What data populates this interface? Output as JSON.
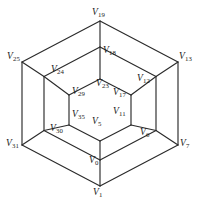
{
  "figure": {
    "type": "graph-diagram",
    "background_color": "#ffffff",
    "edge_color": "#2b2b2b",
    "label_color": "#1a1a1a",
    "width": 200,
    "height": 207
  },
  "graph_data": {
    "type": "diagram",
    "ring_count": 3,
    "vertices_per_ring": 6,
    "rings": [
      {
        "name": "outer",
        "vertices": [
          {
            "id": "V19",
            "prefix": "V",
            "subscript": "19",
            "position": "top",
            "x": 100.0,
            "y": 21.0
          },
          {
            "id": "V13",
            "prefix": "V",
            "subscript": "13",
            "position": "upper-right",
            "x": 178.0,
            "y": 62.0
          },
          {
            "id": "V7",
            "prefix": "V",
            "subscript": "7",
            "position": "lower-right",
            "x": 178.0,
            "y": 145.0
          },
          {
            "id": "V1",
            "prefix": "V",
            "subscript": "1",
            "position": "bottom",
            "x": 100.0,
            "y": 186.0
          },
          {
            "id": "V31",
            "prefix": "V",
            "subscript": "31",
            "position": "lower-left",
            "x": 22.0,
            "y": 145.0
          },
          {
            "id": "V25",
            "prefix": "V",
            "subscript": "25",
            "position": "upper-left",
            "x": 22.0,
            "y": 62.0
          }
        ]
      },
      {
        "name": "middle",
        "vertices": [
          {
            "id": "V18",
            "prefix": "V",
            "subscript": "18",
            "position": "top",
            "x": 100.0,
            "y": 47.0
          },
          {
            "id": "V12",
            "prefix": "V",
            "subscript": "12",
            "position": "upper-right",
            "x": 156.0,
            "y": 76.5
          },
          {
            "id": "V6",
            "prefix": "V",
            "subscript": "6",
            "position": "lower-right",
            "x": 156.0,
            "y": 130.5
          },
          {
            "id": "V0",
            "prefix": "V",
            "subscript": "0",
            "position": "bottom",
            "x": 100.0,
            "y": 160.0
          },
          {
            "id": "V30",
            "prefix": "V",
            "subscript": "30",
            "position": "lower-left",
            "x": 44.0,
            "y": 130.5
          },
          {
            "id": "V24",
            "prefix": "V",
            "subscript": "24",
            "position": "upper-left",
            "x": 44.0,
            "y": 76.5
          }
        ]
      },
      {
        "name": "inner",
        "vertices": [
          {
            "id": "V23",
            "prefix": "V",
            "subscript": "23",
            "position": "top",
            "x": 100.0,
            "y": 79.0
          },
          {
            "id": "V17",
            "prefix": "V",
            "subscript": "17",
            "position": "upper-right",
            "x": 131.0,
            "y": 95.0
          },
          {
            "id": "V11",
            "prefix": "V",
            "subscript": "11",
            "position": "lower-right",
            "x": 131.0,
            "y": 125.0
          },
          {
            "id": "V5",
            "prefix": "V",
            "subscript": "5",
            "position": "bottom",
            "x": 100.0,
            "y": 141.0
          },
          {
            "id": "V35",
            "prefix": "V",
            "subscript": "35",
            "position": "lower-left",
            "x": 69.0,
            "y": 125.0
          },
          {
            "id": "V29",
            "prefix": "V",
            "subscript": "29",
            "position": "upper-left",
            "x": 69.0,
            "y": 95.0
          }
        ]
      }
    ],
    "labels": [
      {
        "id": "V19",
        "prefix": "V",
        "subscript": "19",
        "x": 92.0,
        "y": 8.0
      },
      {
        "id": "V18",
        "prefix": "V",
        "subscript": "18",
        "x": 103.0,
        "y": 46.0
      },
      {
        "id": "V25",
        "prefix": "V",
        "subscript": "25",
        "x": 7.0,
        "y": 52.0
      },
      {
        "id": "V13",
        "prefix": "V",
        "subscript": "13",
        "x": 179.0,
        "y": 52.0
      },
      {
        "id": "V24",
        "prefix": "V",
        "subscript": "24",
        "x": 51.0,
        "y": 65.0
      },
      {
        "id": "V12",
        "prefix": "V",
        "subscript": "12",
        "x": 137.0,
        "y": 74.0
      },
      {
        "id": "V23",
        "prefix": "V",
        "subscript": "23",
        "x": 96.0,
        "y": 79.0
      },
      {
        "id": "V29",
        "prefix": "V",
        "subscript": "29",
        "x": 72.0,
        "y": 87.0
      },
      {
        "id": "V17",
        "prefix": "V",
        "subscript": "17",
        "x": 113.0,
        "y": 88.0
      },
      {
        "id": "V35",
        "prefix": "V",
        "subscript": "35",
        "x": 72.0,
        "y": 110.0
      },
      {
        "id": "V11",
        "prefix": "V",
        "subscript": "11",
        "x": 113.0,
        "y": 107.0
      },
      {
        "id": "V5",
        "prefix": "V",
        "subscript": "5",
        "x": 92.0,
        "y": 117.0
      },
      {
        "id": "V30",
        "prefix": "V",
        "subscript": "30",
        "x": 50.0,
        "y": 124.0
      },
      {
        "id": "V6",
        "prefix": "V",
        "subscript": "6",
        "x": 140.0,
        "y": 128.0
      },
      {
        "id": "V31",
        "prefix": "V",
        "subscript": "31",
        "x": 6.0,
        "y": 139.0
      },
      {
        "id": "V7",
        "prefix": "V",
        "subscript": "7",
        "x": 180.0,
        "y": 139.0
      },
      {
        "id": "V0",
        "prefix": "V",
        "subscript": "0",
        "x": 89.0,
        "y": 156.0
      },
      {
        "id": "V1",
        "prefix": "V",
        "subscript": "1",
        "x": 93.0,
        "y": 188.0
      }
    ],
    "edges": [
      {
        "from": "V19",
        "to": "V13",
        "kind": "ring-outer"
      },
      {
        "from": "V13",
        "to": "V7",
        "kind": "ring-outer"
      },
      {
        "from": "V7",
        "to": "V1",
        "kind": "ring-outer"
      },
      {
        "from": "V1",
        "to": "V31",
        "kind": "ring-outer"
      },
      {
        "from": "V31",
        "to": "V25",
        "kind": "ring-outer"
      },
      {
        "from": "V25",
        "to": "V19",
        "kind": "ring-outer"
      },
      {
        "from": "V18",
        "to": "V12",
        "kind": "ring-middle"
      },
      {
        "from": "V12",
        "to": "V6",
        "kind": "ring-middle"
      },
      {
        "from": "V6",
        "to": "V0",
        "kind": "ring-middle"
      },
      {
        "from": "V0",
        "to": "V30",
        "kind": "ring-middle"
      },
      {
        "from": "V30",
        "to": "V24",
        "kind": "ring-middle"
      },
      {
        "from": "V24",
        "to": "V18",
        "kind": "ring-middle"
      },
      {
        "from": "V23",
        "to": "V17",
        "kind": "ring-inner"
      },
      {
        "from": "V17",
        "to": "V11",
        "kind": "ring-inner"
      },
      {
        "from": "V11",
        "to": "V5",
        "kind": "ring-inner"
      },
      {
        "from": "V5",
        "to": "V35",
        "kind": "ring-inner"
      },
      {
        "from": "V35",
        "to": "V29",
        "kind": "ring-inner"
      },
      {
        "from": "V29",
        "to": "V23",
        "kind": "ring-inner"
      },
      {
        "from": "V19",
        "to": "V18",
        "kind": "spoke-outer"
      },
      {
        "from": "V13",
        "to": "V12",
        "kind": "spoke-outer"
      },
      {
        "from": "V7",
        "to": "V6",
        "kind": "spoke-outer"
      },
      {
        "from": "V1",
        "to": "V0",
        "kind": "spoke-outer"
      },
      {
        "from": "V31",
        "to": "V30",
        "kind": "spoke-outer"
      },
      {
        "from": "V25",
        "to": "V24",
        "kind": "spoke-outer"
      },
      {
        "from": "V18",
        "to": "V23",
        "kind": "spoke-inner"
      },
      {
        "from": "V12",
        "to": "V17",
        "kind": "spoke-inner"
      },
      {
        "from": "V6",
        "to": "V11",
        "kind": "spoke-inner"
      },
      {
        "from": "V0",
        "to": "V5",
        "kind": "spoke-inner"
      },
      {
        "from": "V30",
        "to": "V35",
        "kind": "spoke-inner"
      },
      {
        "from": "V24",
        "to": "V29",
        "kind": "spoke-inner"
      }
    ]
  }
}
